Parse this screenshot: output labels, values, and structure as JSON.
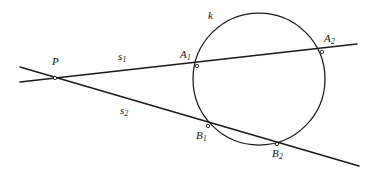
{
  "figure": {
    "kind": "geometry-diagram",
    "width": 372,
    "height": 180,
    "background_color": "#ffffff",
    "ink_color": "#1a1a1a"
  },
  "labels": {
    "point_P": {
      "base": "P",
      "sub": ""
    },
    "circle_k": {
      "base": "k",
      "sub": ""
    },
    "secant_s1": {
      "base": "s",
      "sub": "1"
    },
    "secant_s2": {
      "base": "s",
      "sub": "2"
    },
    "point_A1": {
      "base": "A",
      "sub": "1"
    },
    "point_A2": {
      "base": "A",
      "sub": "2"
    },
    "point_B1": {
      "base": "B",
      "sub": "1"
    },
    "point_B2": {
      "base": "B",
      "sub": "2"
    }
  },
  "geometry": {
    "circle": {
      "cx": 259,
      "cy": 79,
      "r": 66
    },
    "points": {
      "P": {
        "x": 55,
        "y": 78
      },
      "A1": {
        "x": 197,
        "y": 66
      },
      "A2": {
        "x": 322,
        "y": 52
      },
      "B1": {
        "x": 208,
        "y": 126
      },
      "B2": {
        "x": 277,
        "y": 144
      }
    },
    "lines": {
      "s1": {
        "x1": 20,
        "y1": 82,
        "x2": 357,
        "y2": 44
      },
      "s2": {
        "x1": 20,
        "y1": 67,
        "x2": 359,
        "y2": 166
      }
    }
  }
}
